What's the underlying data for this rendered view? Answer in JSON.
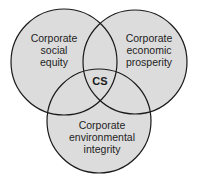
{
  "diagram": {
    "type": "venn",
    "colors": {
      "fill": "#dcdcdc",
      "stroke": "#1a1a1a",
      "background": "#ffffff"
    },
    "circles": [
      {
        "id": "social",
        "lines": [
          "Corporate",
          "social",
          "equity"
        ]
      },
      {
        "id": "economic",
        "lines": [
          "Corporate",
          "economic",
          "prosperity"
        ]
      },
      {
        "id": "environmental",
        "lines": [
          "Corporate",
          "environmental",
          "integrity"
        ]
      }
    ],
    "intersection_label": "CS"
  }
}
